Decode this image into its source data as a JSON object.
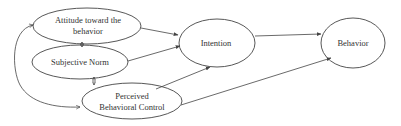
{
  "diagram": {
    "stroke_color": "#444444",
    "text_color": "#333333",
    "background": "#ffffff",
    "nodes": [
      {
        "id": "attitude",
        "line1": "Attitude toward the",
        "line2": "behavior",
        "cx": 87,
        "cy": 26,
        "rx": 54,
        "ry": 18
      },
      {
        "id": "subjective_norm",
        "line1": "Subjective Norm",
        "line2": "",
        "cx": 80,
        "cy": 62,
        "rx": 48,
        "ry": 17
      },
      {
        "id": "pbc",
        "line1": "Perceived",
        "line2": "Behavioral Control",
        "cx": 132,
        "cy": 101,
        "rx": 50,
        "ry": 18
      },
      {
        "id": "intention",
        "line1": "Intention",
        "line2": "",
        "cx": 217,
        "cy": 43,
        "rx": 38,
        "ry": 24
      },
      {
        "id": "behavior",
        "line1": "Behavior",
        "line2": "",
        "cx": 353,
        "cy": 43,
        "rx": 32,
        "ry": 25
      }
    ],
    "edges": [
      {
        "from": "attitude",
        "to": "intention",
        "type": "directed"
      },
      {
        "from": "subjective_norm",
        "to": "intention",
        "type": "directed"
      },
      {
        "from": "pbc",
        "to": "intention",
        "type": "directed"
      },
      {
        "from": "intention",
        "to": "behavior",
        "type": "directed"
      },
      {
        "from": "pbc",
        "to": "behavior",
        "type": "directed"
      },
      {
        "from": "attitude",
        "to": "subjective_norm",
        "type": "bidirectional"
      },
      {
        "from": "subjective_norm",
        "to": "pbc",
        "type": "bidirectional"
      },
      {
        "from": "attitude",
        "to": "pbc",
        "type": "bidirectional-curved"
      }
    ]
  }
}
